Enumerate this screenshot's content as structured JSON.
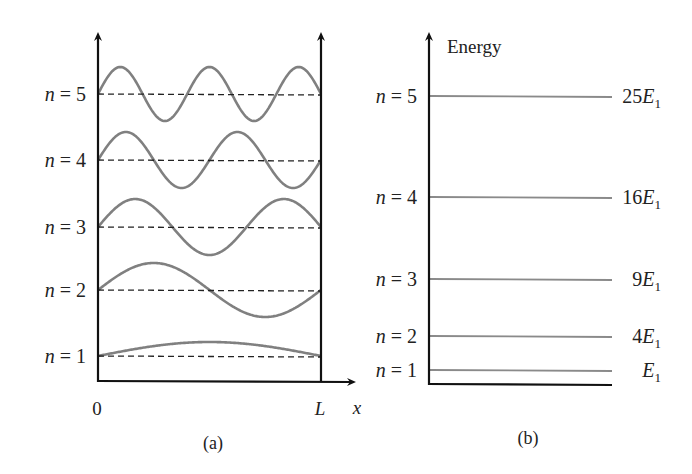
{
  "panel_a": {
    "caption": "(a)",
    "x_origin_label": "0",
    "x_end_label": "L",
    "x_axis_label": "x",
    "states": [
      {
        "n": 1,
        "label_n": "n",
        "label_eq": " = 1",
        "baseline_y": 356,
        "amplitude": 14
      },
      {
        "n": 2,
        "label_n": "n",
        "label_eq": " = 2",
        "baseline_y": 290,
        "amplitude": 27
      },
      {
        "n": 3,
        "label_n": "n",
        "label_eq": " = 3",
        "baseline_y": 227,
        "amplitude": 28
      },
      {
        "n": 4,
        "label_n": "n",
        "label_eq": " = 4",
        "baseline_y": 160,
        "amplitude": 28
      },
      {
        "n": 5,
        "label_n": "n",
        "label_eq": " = 5",
        "baseline_y": 94,
        "amplitude": 27
      }
    ]
  },
  "panel_b": {
    "caption": "(b)",
    "y_axis_label": "Energy",
    "levels": [
      {
        "n": 1,
        "label_n": "n",
        "label_eq": " = 1",
        "y": 370,
        "coef": "",
        "sym": "E",
        "sub": "1"
      },
      {
        "n": 2,
        "label_n": "n",
        "label_eq": " = 2",
        "y": 336,
        "coef": "4",
        "sym": "E",
        "sub": "1"
      },
      {
        "n": 3,
        "label_n": "n",
        "label_eq": " = 3",
        "y": 279,
        "coef": "9",
        "sym": "E",
        "sub": "1"
      },
      {
        "n": 4,
        "label_n": "n",
        "label_eq": " = 4",
        "y": 197,
        "coef": "16",
        "sym": "E",
        "sub": "1"
      },
      {
        "n": 5,
        "label_n": "n",
        "label_eq": " = 5",
        "y": 96,
        "coef": "25",
        "sym": "E",
        "sub": "1"
      }
    ]
  },
  "colors": {
    "axis": "#111111",
    "wave": "#808080",
    "dashed": "#222222",
    "level": "#8a8a8a",
    "text": "#222222"
  }
}
